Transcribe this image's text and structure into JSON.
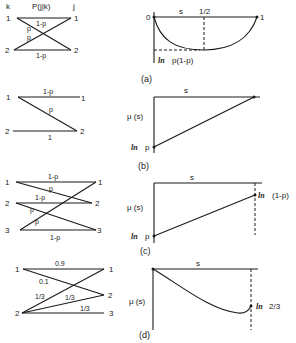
{
  "panel_a": {
    "caption": "(a)",
    "channel": {
      "input_header": "k",
      "output_header": "j",
      "title": "P(j|k)",
      "inputs": [
        "1",
        "2"
      ],
      "outputs": [
        "1",
        "2"
      ],
      "edge_labels": {
        "top": "1-p",
        "cross_upper": "p",
        "cross_lower": "p",
        "bottom": "1-p"
      }
    },
    "plot": {
      "x_label": "s",
      "left_tick": "0",
      "mid_tick": "1/2",
      "right_tick": "1",
      "min_label_ln": "ln",
      "min_label": "p(1-p)"
    }
  },
  "panel_b": {
    "caption": "(b)",
    "channel": {
      "inputs": [
        "1",
        "2"
      ],
      "outputs": [
        "1",
        "2"
      ],
      "edge_labels": {
        "top": "1-p",
        "diag": "p",
        "bottom": "1"
      }
    },
    "plot": {
      "x_label": "s",
      "y_label": "μ (s)",
      "start_label_ln": "ln",
      "start_label": "p"
    }
  },
  "panel_c": {
    "caption": "(c)",
    "channel": {
      "inputs": [
        "1",
        "2",
        "3"
      ],
      "outputs": [
        "1",
        "2",
        "3"
      ],
      "edge_labels": {
        "top": "1-p",
        "p1": "p",
        "mid": "1-p",
        "p2": "p",
        "p3": "p",
        "bottom": "1-p"
      }
    },
    "plot": {
      "x_label": "s",
      "y_label": "μ (s)",
      "start_label_ln": "ln",
      "start_label": "p",
      "end_label_ln": "ln",
      "end_label": "(1-p)"
    }
  },
  "panel_d": {
    "caption": "(d)",
    "channel": {
      "inputs": [
        "1",
        "2"
      ],
      "outputs": [
        "1",
        "2",
        "3"
      ],
      "edge_labels": {
        "top": "0.9",
        "cross": "0.1",
        "a": "1/3",
        "b": "1/3",
        "c": "1/3"
      }
    },
    "plot": {
      "x_label": "s",
      "y_label": "μ (s)",
      "end_label_ln": "ln",
      "end_label": "2/3"
    }
  }
}
